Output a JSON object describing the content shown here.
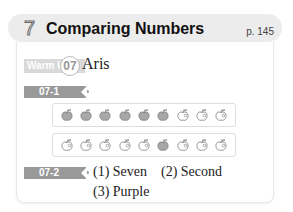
{
  "header": {
    "chapter_number": "7",
    "title": "Comparing Numbers",
    "page_ref": "p. 145"
  },
  "warm_up": {
    "label": "Warm Up",
    "number": "07",
    "answer": "Aris"
  },
  "q1": {
    "tag": "07-1",
    "rows": [
      {
        "filled": [
          true,
          true,
          true,
          true,
          true,
          true,
          false,
          false,
          false
        ]
      },
      {
        "filled": [
          false,
          false,
          false,
          false,
          false,
          true,
          false,
          false,
          false
        ]
      }
    ]
  },
  "q2": {
    "tag": "07-2",
    "answers": [
      "(1) Seven",
      "(2) Second",
      "(3) Purple"
    ]
  },
  "colors": {
    "filled_apple": "#a8a8a8",
    "outline": "#777777",
    "tag_bg": "#999999"
  }
}
